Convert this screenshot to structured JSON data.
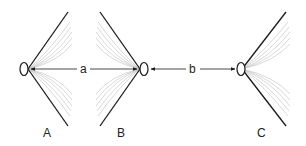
{
  "diagram": {
    "type": "antenna-spacing-diagram",
    "colors": {
      "line": "#1a1a1a",
      "fan": "#bdbdbd",
      "background": "#ffffff"
    },
    "devices": [
      {
        "id": "A",
        "label": "A",
        "orientation": "opens-right"
      },
      {
        "id": "B",
        "label": "B",
        "orientation": "opens-left"
      },
      {
        "id": "C",
        "label": "C",
        "orientation": "opens-right"
      }
    ],
    "distances": [
      {
        "id": "a",
        "label": "a",
        "from": "A",
        "to": "B"
      },
      {
        "id": "b",
        "label": "b",
        "from": "B",
        "to": "C"
      }
    ]
  }
}
